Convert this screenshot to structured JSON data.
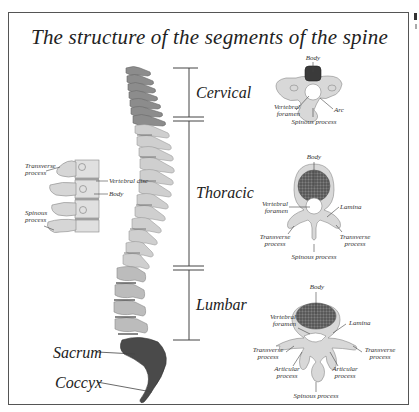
{
  "title": "The structure of the segments of the spine",
  "regions": [
    {
      "label": "Cervical"
    },
    {
      "label": "Thoracic"
    },
    {
      "label": "Lumbar"
    }
  ],
  "lower_labels": {
    "sacrum": "Sacrum",
    "coccyx": "Coccyx"
  },
  "side_view": {
    "transverse_process": "Transverse process",
    "vertebral_disc": "Vertebral disc",
    "body": "Body",
    "spinous_process": "Spinous process"
  },
  "cervical_vertebra": {
    "body": "Body",
    "vertebral_foramen": "Vertebral foramen",
    "arc": "Arc",
    "spinous_process": "Spinous process"
  },
  "thoracic_vertebra": {
    "body": "Body",
    "vertebral_foramen": "Vertebral foramen",
    "lamina": "Lamina",
    "transverse_process_left": "Transverse process",
    "transverse_process_right": "Transverse process",
    "spinous_process": "Spinous process"
  },
  "lumbar_vertebra": {
    "body": "Body",
    "vertebral_foramen": "Vertebral foramen",
    "lamina": "Lamina",
    "transverse_process_left": "Transverse process",
    "transverse_process_right": "Transverse process",
    "articular_process_left": "Articular process",
    "articular_process_right": "Articular process",
    "spinous_process": "Spinous process"
  },
  "colors": {
    "cervical_bone": "#8a8a8a",
    "thoracic_bone": "#c8c8c8",
    "lumbar_bone": "#b4b4b4",
    "sacrum": "#4a4a4a",
    "vertebra_body_fill": "#555555",
    "bone_light": "#d9d9d9",
    "line": "#444444",
    "frame": "#555555"
  }
}
